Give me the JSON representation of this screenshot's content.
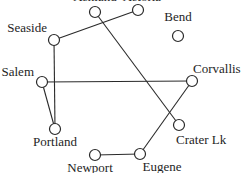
{
  "diagram": {
    "type": "graph",
    "nodes": [
      {
        "id": "ashland",
        "label": "Ashland",
        "x": 95,
        "y": 12,
        "lx": 95,
        "ly": 1,
        "anchor": "middle"
      },
      {
        "id": "astoria",
        "label": "Astoria",
        "x": 138,
        "y": 10,
        "lx": 142,
        "ly": 1,
        "anchor": "middle"
      },
      {
        "id": "bend",
        "label": "Bend",
        "x": 178,
        "y": 36,
        "lx": 178,
        "ly": 21,
        "anchor": "middle"
      },
      {
        "id": "seaside",
        "label": "Seaside",
        "x": 54,
        "y": 40,
        "lx": 47,
        "ly": 32,
        "anchor": "end"
      },
      {
        "id": "salem",
        "label": "Salem",
        "x": 42,
        "y": 82,
        "lx": 34,
        "ly": 76,
        "anchor": "end"
      },
      {
        "id": "corvallis",
        "label": "Corvallis",
        "x": 192,
        "y": 81,
        "lx": 193,
        "ly": 73,
        "anchor": "start"
      },
      {
        "id": "portland",
        "label": "Portland",
        "x": 55,
        "y": 129,
        "lx": 55,
        "ly": 146,
        "anchor": "middle"
      },
      {
        "id": "craterlk",
        "label": "Crater Lk",
        "x": 179,
        "y": 125,
        "lx": 176,
        "ly": 144,
        "anchor": "start"
      },
      {
        "id": "newport",
        "label": "Newport",
        "x": 95,
        "y": 155,
        "lx": 90,
        "ly": 172,
        "anchor": "middle"
      },
      {
        "id": "eugene",
        "label": "Eugene",
        "x": 140,
        "y": 154,
        "lx": 162,
        "ly": 171,
        "anchor": "middle"
      }
    ],
    "edges": [
      {
        "from": "seaside",
        "to": "astoria"
      },
      {
        "from": "seaside",
        "to": "portland"
      },
      {
        "from": "salem",
        "to": "portland"
      },
      {
        "from": "salem",
        "to": "corvallis"
      },
      {
        "from": "ashland",
        "to": "craterlk"
      },
      {
        "from": "corvallis",
        "to": "eugene"
      },
      {
        "from": "newport",
        "to": "eugene"
      }
    ],
    "node_radius": 5.5
  }
}
